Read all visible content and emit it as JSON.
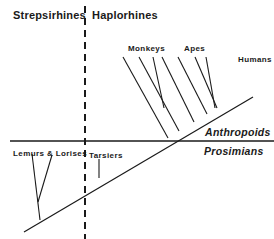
{
  "headers": {
    "left": "Strepsirhines",
    "right": "Haplorhines"
  },
  "groups": {
    "upper": "Anthropoids",
    "lower": "Prosimians"
  },
  "taxa": {
    "monkeys": "Monkeys",
    "apes": "Apes",
    "humans": "Humans",
    "lemurs_lorises": "Lemurs & Lorises",
    "tarsiers": "Tarsiers"
  },
  "colors": {
    "ink": "#1a1a1a",
    "background": "#ffffff"
  }
}
